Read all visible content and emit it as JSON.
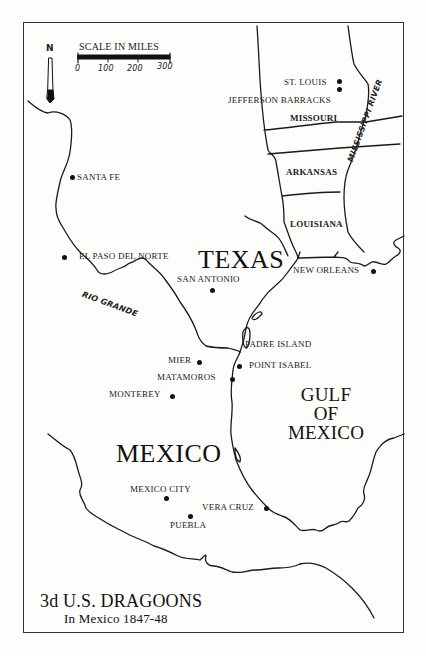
{
  "map": {
    "title": "3d U.S. DRAGOONS",
    "subtitle": "In Mexico 1847-48",
    "north_arrow": {
      "icon": "north-arrow-icon",
      "label": "N"
    },
    "scale": {
      "title": "SCALE IN MILES",
      "ticks": [
        "0",
        "100",
        "200",
        "300"
      ]
    },
    "regions": {
      "texas": "TEXAS",
      "mexico": "MEXICO",
      "gulf": [
        "GULF",
        "OF",
        "MEXICO"
      ],
      "missouri": "MISSOURI",
      "arkansas": "ARKANSAS",
      "louisiana": "LOUISIANA"
    },
    "rivers": {
      "mississippi": "MISSISSIPPI RIVER",
      "rio_grande": "RIO GRANDE"
    },
    "places": {
      "st_louis": "ST. LOUIS",
      "jefferson_barracks": "JEFFERSON BARRACKS",
      "santa_fe": "SANTA FE",
      "el_paso": "EL PASO DEL NORTE",
      "san_antonio": "SAN ANTONIO",
      "new_orleans": "NEW ORLEANS",
      "padre_island": "PADRE ISLAND",
      "point_isabel": "POINT ISABEL",
      "mier": "MIER",
      "matamoros": "MATAMOROS",
      "monterey": "MONTEREY",
      "mexico_city": "MEXICO CITY",
      "puebla": "PUEBLA",
      "vera_cruz": "VERA CRUZ"
    }
  }
}
